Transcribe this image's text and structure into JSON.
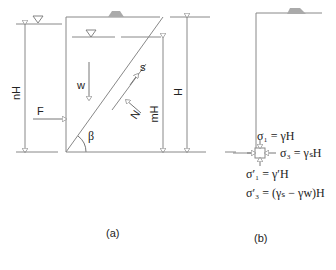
{
  "panel_a": {
    "caption": "(a)",
    "labels": {
      "nH": "nH",
      "F": "F",
      "w": "w",
      "s": "s",
      "N": "N",
      "mH": "mH",
      "H": "H",
      "beta": "β"
    }
  },
  "panel_b": {
    "caption": "(b)",
    "equations": {
      "sigma1": "σ₁ = γH",
      "sigma3": "σ₃ = γₛH",
      "sigma1_eff": "σ′₁ = γ′H",
      "sigma3_eff": "σ′₃ = (γₛ − γw)H"
    }
  },
  "colors": {
    "line": "#888888",
    "text": "#222222",
    "hatch": "#999999"
  }
}
